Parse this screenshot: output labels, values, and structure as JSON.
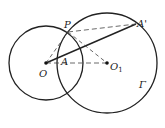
{
  "diagram": {
    "labels": {
      "P": "P",
      "A_prime": "A'",
      "O": "O",
      "A": "A",
      "O1": "O",
      "O1_sub": "1",
      "Gamma": "Γ"
    },
    "circles": [
      {
        "name": "small-circle",
        "center": "O",
        "cx": 46,
        "cy": 63,
        "r": 37
      },
      {
        "name": "circle-gamma",
        "center": "O1",
        "cx": 107,
        "cy": 63,
        "r": 50
      }
    ],
    "points": {
      "O": [
        46,
        63
      ],
      "O1": [
        107,
        63
      ],
      "P": [
        68,
        32
      ],
      "A_prime": [
        136,
        24
      ],
      "A": [
        64,
        63
      ]
    },
    "segments": [
      {
        "from": "O",
        "to": "A_prime",
        "style": "solid"
      },
      {
        "from": "P",
        "to": "A_prime",
        "style": "dashed"
      },
      {
        "from": "O",
        "to": "P",
        "style": "dashed"
      },
      {
        "from": "P",
        "to": "O1",
        "style": "dashed"
      },
      {
        "from": "O",
        "to": "O1",
        "style": "dashed"
      }
    ],
    "colors": {
      "stroke": "#222222",
      "background": "#ffffff"
    }
  }
}
